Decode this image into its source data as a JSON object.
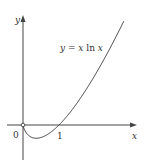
{
  "chart_data": {
    "type": "line",
    "title": "",
    "function_label": "y = x ln x",
    "xlabel": "x",
    "ylabel": "y",
    "x_ticks": [
      {
        "value": 0,
        "label": "0"
      },
      {
        "value": 1,
        "label": "1"
      }
    ],
    "xlim": [
      -0.45,
      3.2
    ],
    "ylim": [
      -0.95,
      3.05
    ],
    "grid": false,
    "legend": "none",
    "series": [
      {
        "name": "y = x ln x",
        "x": [
          0.0,
          0.1,
          0.2,
          0.3679,
          0.5,
          0.75,
          1.0,
          1.5,
          2.0,
          2.5,
          2.8
        ],
        "values": [
          0.0,
          -0.23,
          -0.32,
          -0.368,
          -0.347,
          -0.216,
          0.0,
          0.608,
          1.386,
          2.291,
          2.883
        ]
      }
    ],
    "annotations": [
      "open circle at origin (0,0)"
    ],
    "colors": {
      "curve": "#333333",
      "axes": "#444444"
    }
  },
  "labels": {
    "function": "y = x ln x",
    "x_axis": "x",
    "y_axis": "y",
    "origin": "0",
    "one": "1"
  }
}
